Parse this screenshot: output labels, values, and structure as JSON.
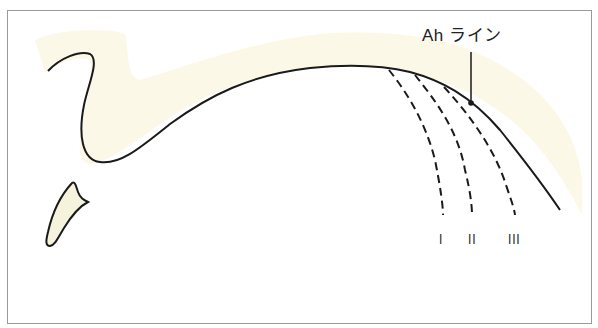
{
  "figure": {
    "type": "schematic cross-section diagram",
    "annotation": {
      "label": "Ah ライン",
      "pointer": "leader line to point on curve"
    },
    "dashed_lines": [
      {
        "id": "I",
        "label": "I"
      },
      {
        "id": "II",
        "label": "II"
      },
      {
        "id": "III",
        "label": "III"
      }
    ],
    "colors": {
      "fill": "#fcf8e8",
      "stroke": "#1a1a1a",
      "frame": "#9a9a9a",
      "background": "#ffffff"
    }
  }
}
